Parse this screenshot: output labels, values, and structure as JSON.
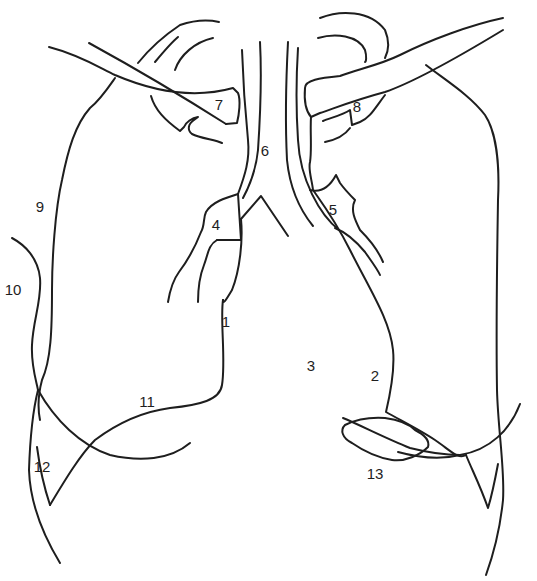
{
  "diagram": {
    "type": "anatomical-line-drawing",
    "colors": {
      "background": "#ffffff",
      "line": "#1e1e1e"
    },
    "labels": [
      {
        "id": "1",
        "text": "1",
        "x": 226,
        "y": 327
      },
      {
        "id": "2",
        "text": "2",
        "x": 375,
        "y": 381
      },
      {
        "id": "3",
        "text": "3",
        "x": 311,
        "y": 371
      },
      {
        "id": "4",
        "text": "4",
        "x": 216,
        "y": 230
      },
      {
        "id": "5",
        "text": "5",
        "x": 333,
        "y": 215
      },
      {
        "id": "6",
        "text": "6",
        "x": 265,
        "y": 156
      },
      {
        "id": "7",
        "text": "7",
        "x": 219,
        "y": 110
      },
      {
        "id": "8",
        "text": "8",
        "x": 357,
        "y": 112
      },
      {
        "id": "9",
        "text": "9",
        "x": 40,
        "y": 212
      },
      {
        "id": "10",
        "text": "10",
        "x": 13,
        "y": 295
      },
      {
        "id": "11",
        "text": "11",
        "x": 147,
        "y": 407
      },
      {
        "id": "12",
        "text": "12",
        "x": 42,
        "y": 472
      },
      {
        "id": "13",
        "text": "13",
        "x": 375,
        "y": 479
      }
    ],
    "paths": [
      {
        "name": "left-clavicle-upper",
        "d": "M49 47 C80 55 100 68 115 75 C150 90 190 100 233 88 L238 93 C241 100 239 115 237 123 L226 124"
      },
      {
        "name": "left-clavicle-lower",
        "d": "M89 43 C120 60 160 82 226 124"
      },
      {
        "name": "left-scapula-arc-outer",
        "d": "M138 63 C150 48 165 35 180 25 C195 20 210 20 219 22"
      },
      {
        "name": "left-scapula-arc-inner",
        "d": "M155 62 C165 50 172 42 178 37"
      },
      {
        "name": "left-scapula-arc-3",
        "d": "M175 70 C180 55 195 42 213 38"
      },
      {
        "name": "left-coracoid",
        "d": "M151 96 C155 110 165 120 180 131 L184 127 C186 122 192 118 198 117 L194 120 C188 124 187 130 192 134 C200 138 215 140 222 143"
      },
      {
        "name": "left-lung-lateral",
        "d": "M115 78 C108 88 100 100 90 108 C75 125 68 150 62 180 C55 210 52 260 52 290 C52 330 51 360 42 380 C38 395 38 410 40 420"
      },
      {
        "name": "left-chest-wall-10",
        "d": "M12 238 C25 245 38 258 40 278 C42 300 33 320 32 345 C31 365 36 380 38 390"
      },
      {
        "name": "left-chest-wall-lower",
        "d": "M38 390 C33 410 30 440 29 470 C30 500 40 530 60 563"
      },
      {
        "name": "left-diaphragm-11",
        "d": "M223 300 C220 320 226 360 222 385 C220 400 200 405 170 408 C140 412 115 425 95 440 C80 455 65 480 50 505"
      },
      {
        "name": "left-costophrenic",
        "d": "M38 390 C55 420 80 445 110 455 C140 462 170 460 190 443"
      },
      {
        "name": "left-12-v",
        "d": "M37 447 C40 470 45 490 50 505"
      },
      {
        "name": "trachea-left-outer",
        "d": "M242 50 C243 80 245 110 248 140 C250 160 245 175 238 194"
      },
      {
        "name": "trachea-left-inner",
        "d": "M260 42 C262 80 260 120 258 150 C256 170 250 185 243 198"
      },
      {
        "name": "trachea-right-inner",
        "d": "M288 42 C286 80 285 120 287 160 C290 190 300 210 313 226"
      },
      {
        "name": "trachea-right-outer",
        "d": "M298 48 C296 80 296 110 298 140 C300 180 320 215 339 230"
      },
      {
        "name": "carina",
        "d": "M241 219 L261 196 L288 236"
      },
      {
        "name": "left-bronchus-4-upper",
        "d": "M238 194 C225 198 212 202 206 212 C203 218 205 225 201 232 C196 245 188 260 179 272 C173 280 170 290 168 302"
      },
      {
        "name": "left-bronchus-4-box",
        "d": "M217 240 L241 240 L238 194"
      },
      {
        "name": "left-bronchus-4-inner",
        "d": "M217 240 C208 245 208 255 204 265 C200 275 198 290 198 302"
      },
      {
        "name": "left-main-bronchus",
        "d": "M241 219 C243 240 240 270 232 290 C226 300 223 305 223 300"
      },
      {
        "name": "right-clavicle-upper",
        "d": "M503 18 C470 25 430 40 400 55 C380 65 355 70 340 76 C320 78 305 80 305 88 C304 100 305 110 311 117 L320 113 C335 108 355 100 385 92 C420 80 470 50 503 30"
      },
      {
        "name": "right-scapula-arc-outer",
        "d": "M320 18 C340 10 370 10 385 30 C390 42 388 52 385 58"
      },
      {
        "name": "right-scapula-arc-inner",
        "d": "M318 38 C335 33 358 35 365 50 C367 57 366 62 365 62"
      },
      {
        "name": "right-coracoid-8",
        "d": "M323 121 C330 118 343 115 350 110 L352 125 L360 122 C370 118 375 108 385 95"
      },
      {
        "name": "right-coracoid-lower",
        "d": "M325 142 C335 140 345 135 350 128"
      },
      {
        "name": "right-lung-lateral",
        "d": "M426 65 C445 80 470 95 485 115 C495 130 500 160 498 200 C497 260 496 330 497 390 C498 430 505 470 503 500 C500 530 495 550 486 575"
      },
      {
        "name": "right-chest-wall",
        "d": "M520 404 C510 430 490 450 460 455 C440 460 420 458 398 452"
      },
      {
        "name": "right-12-v",
        "d": "M498 464 C495 480 492 495 488 508 C480 485 472 470 466 455"
      },
      {
        "name": "right-mediastinum-2",
        "d": "M311 117 C310 130 312 150 310 162 C308 170 312 180 313 190 C320 200 335 220 350 250 C370 290 390 320 393 350 C395 370 390 395 386 412 C400 420 420 430 435 440 C450 450 458 460 466 455"
      },
      {
        "name": "right-bronchus-5",
        "d": "M310 190 C318 192 328 190 336 175 L340 183 C345 190 350 195 355 200 C350 210 355 220 360 230 C370 240 378 250 383 262"
      },
      {
        "name": "right-bronchus-5-inner",
        "d": "M335 228 C345 232 355 240 365 252 C372 262 378 270 380 275"
      },
      {
        "name": "right-diaphragm-13-blob",
        "d": "M345 425 C340 430 342 438 352 443 C365 452 380 458 392 460 C405 462 420 455 428 447 C430 440 425 435 415 430 C410 425 400 420 385 418 C370 417 355 420 345 425 Z"
      },
      {
        "name": "right-diaphragm-13-line",
        "d": "M343 418 C360 425 385 438 410 448 C430 453 445 455 460 455"
      }
    ]
  }
}
